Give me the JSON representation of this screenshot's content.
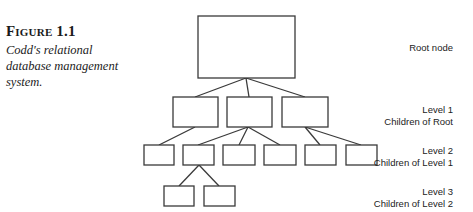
{
  "figure": {
    "label": "Figure 1.1",
    "caption": "Codd's relational database management system."
  },
  "diagram": {
    "type": "hierarchical tree",
    "line_color": "#3a3a3a",
    "labels": {
      "root": "Root node",
      "level1_title": "Level 1",
      "level1_sub": "Children of Root",
      "level2_title": "Level 2",
      "level2_sub": "Children of Level 1",
      "level3_title": "Level 3",
      "level3_sub": "Children of Level 2"
    },
    "nodes": [
      {
        "id": "root",
        "level": 0,
        "children": [
          "l1a",
          "l1b",
          "l1c"
        ]
      },
      {
        "id": "l1a",
        "level": 1,
        "children": [
          "l2a"
        ]
      },
      {
        "id": "l1b",
        "level": 1,
        "children": [
          "l2b",
          "l2c",
          "l2d"
        ]
      },
      {
        "id": "l1c",
        "level": 1,
        "children": [
          "l2e",
          "l2f"
        ]
      },
      {
        "id": "l2a",
        "level": 2,
        "children": []
      },
      {
        "id": "l2b",
        "level": 2,
        "children": [
          "l3a",
          "l3b"
        ]
      },
      {
        "id": "l2c",
        "level": 2,
        "children": []
      },
      {
        "id": "l2d",
        "level": 2,
        "children": []
      },
      {
        "id": "l2e",
        "level": 2,
        "children": []
      },
      {
        "id": "l2f",
        "level": 2,
        "children": []
      },
      {
        "id": "l3a",
        "level": 3,
        "children": []
      },
      {
        "id": "l3b",
        "level": 3,
        "children": []
      }
    ]
  }
}
